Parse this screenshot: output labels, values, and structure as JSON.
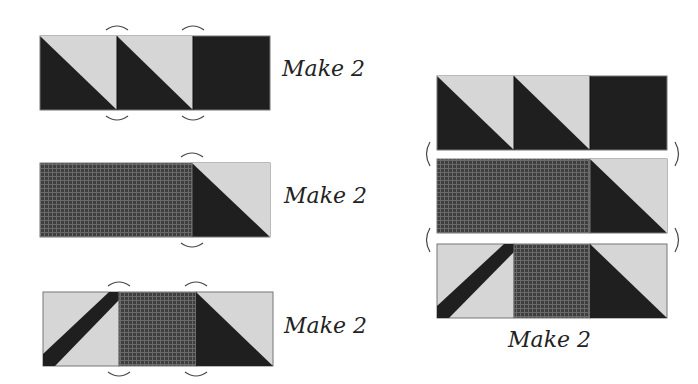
{
  "colors": {
    "dark": "#1f1f1f",
    "light": "#d6d6d6",
    "print": "#4a4a4a",
    "outline": "#777777",
    "seam": "#555555"
  },
  "units": [
    {
      "id": "unit-a",
      "label": "Make 2"
    },
    {
      "id": "unit-b",
      "label": "Make 2"
    },
    {
      "id": "unit-c",
      "label": "Make 2"
    },
    {
      "id": "assembled-block",
      "label": "Make 2"
    }
  ]
}
